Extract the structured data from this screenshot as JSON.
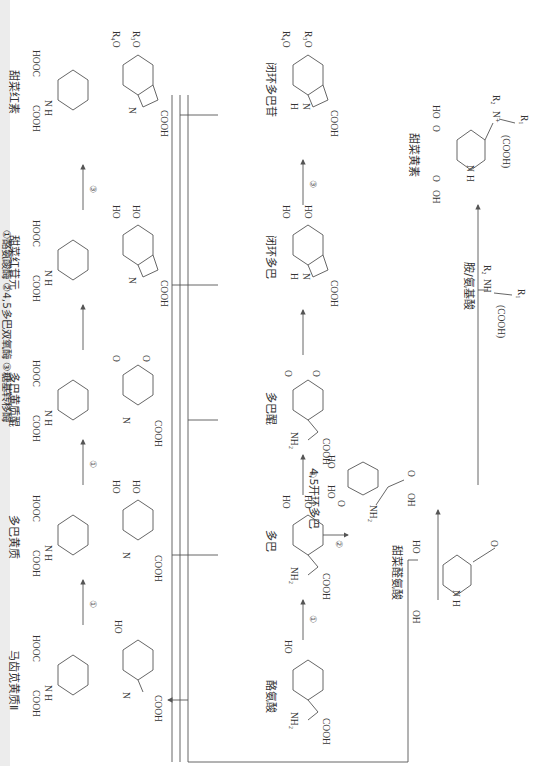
{
  "diagram": {
    "orientation": "rotated 90 degrees clockwise",
    "compounds": [
      {
        "id": "tyrosine",
        "label": "酪氨酸",
        "groups": [
          "HO",
          "COOH",
          "NH2"
        ]
      },
      {
        "id": "dopa",
        "label": "多巴",
        "groups": [
          "HO",
          "HO",
          "COOH",
          "NH2"
        ]
      },
      {
        "id": "dopaquinone",
        "label": "多巴醌",
        "groups": [
          "O",
          "O",
          "COOH",
          "NH2"
        ]
      },
      {
        "id": "cyclo_dopa",
        "label": "闭环多巴",
        "groups": [
          "HO",
          "HO",
          "COOH",
          "N",
          "H"
        ]
      },
      {
        "id": "cyclo_dopa_glucoside",
        "label": "闭环多巴苷",
        "groups": [
          "R3O",
          "R4O",
          "COOH",
          "N",
          "H"
        ]
      },
      {
        "id": "seco_dopa",
        "label": "4,5开环多巴",
        "groups": [
          "HO",
          "HO",
          "O",
          "O",
          "OH",
          "NH2"
        ]
      },
      {
        "id": "betalamic_acid",
        "label": "甜菜醛氨酸",
        "groups": [
          "O",
          "HO",
          "O",
          "OH",
          "N",
          "H"
        ]
      },
      {
        "id": "amine_amino_acid",
        "label": "胺/氨基酸",
        "groups": [
          "R1",
          "R2",
          "NH",
          "(COOH)"
        ]
      },
      {
        "id": "betaxanthin",
        "label": "甜菜黄素",
        "groups": [
          "R1",
          "R2",
          "N+",
          "(COOH)",
          "HO",
          "O",
          "OH",
          "N",
          "H"
        ]
      },
      {
        "id": "portulacaxanthin_II",
        "label": "马齿苋黄质Ⅱ",
        "groups": [
          "HO",
          "COOH",
          "N",
          "HOOC",
          "COOH",
          "H"
        ]
      },
      {
        "id": "dopaxanthin",
        "label": "多巴黄质",
        "groups": [
          "HO",
          "HO",
          "COOH",
          "N",
          "HOOC",
          "COOH",
          "H"
        ]
      },
      {
        "id": "dopaxanthin_quinone",
        "label": "多巴黄质醌",
        "groups": [
          "O",
          "O",
          "COOH",
          "N",
          "HOOC",
          "COOH",
          "H"
        ]
      },
      {
        "id": "betanidin",
        "label": "甜菜红苷元",
        "groups": [
          "HO",
          "HO",
          "COOH",
          "N",
          "HOOC",
          "COOH",
          "H"
        ]
      },
      {
        "id": "betanin",
        "label": "甜菜红素",
        "groups": [
          "R3O",
          "R4O",
          "COOH",
          "N",
          "HOOC",
          "COOH",
          "H"
        ]
      }
    ],
    "reactions": [
      {
        "from": "tyrosine",
        "to": "dopa",
        "enzyme": "①"
      },
      {
        "from": "dopa",
        "to": "dopaquinone",
        "enzyme": "①"
      },
      {
        "from": "dopaquinone",
        "to": "cyclo_dopa",
        "enzyme": ""
      },
      {
        "from": "cyclo_dopa",
        "to": "cyclo_dopa_glucoside",
        "enzyme": "③"
      },
      {
        "from": "dopa",
        "to": "seco_dopa",
        "enzyme": "②"
      },
      {
        "from": "seco_dopa",
        "to": "betalamic_acid",
        "enzyme": ""
      },
      {
        "from": "betalamic_acid",
        "to": "betaxanthin",
        "enzyme": "",
        "cofactor": "amine_amino_acid"
      },
      {
        "from": "portulacaxanthin_II",
        "to": "dopaxanthin",
        "enzyme": "①"
      },
      {
        "from": "dopaxanthin",
        "to": "dopaxanthin_quinone",
        "enzyme": "①"
      },
      {
        "from": "dopaxanthin_quinone",
        "to": "betanidin",
        "enzyme": ""
      },
      {
        "from": "betanidin",
        "to": "betanin",
        "enzyme": "③"
      }
    ],
    "enzyme_marks": {
      "e1": "①",
      "e2": "②",
      "e3": "③"
    },
    "caption": "①酪氨酸酶 ②4,5多巴双氧酶 ③糖基转移酶"
  }
}
